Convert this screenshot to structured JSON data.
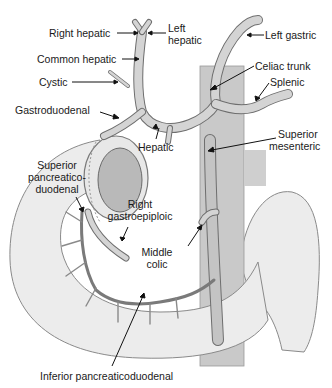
{
  "figure": {
    "colors": {
      "vessel_fill": "#d4d4d4",
      "vessel_stroke": "#6e6e6e",
      "organ_fill": "#ececec",
      "organ_stroke": "#8a8a8a",
      "aorta_fill": "#c9c9c9",
      "text": "#1a1a1a",
      "leader": "#111111"
    },
    "labels": {
      "right_hepatic": "Right hepatic",
      "left_hepatic_1": "Left",
      "left_hepatic_2": "hepatic",
      "left_gastric": "Left gastric",
      "common_hepatic": "Common hepatic",
      "celiac_trunk": "Celiac trunk",
      "cystic": "Cystic",
      "splenic": "Splenic",
      "gastroduodenal": "Gastroduodenal",
      "hepatic": "Hepatic",
      "superior_mesenteric_1": "Superior",
      "superior_mesenteric_2": "mesenteric",
      "sup_pd_1": "Superior",
      "sup_pd_2": "pancreatico-",
      "sup_pd_3": "duodenal",
      "right_gastroepiploic_1": "Right",
      "right_gastroepiploic_2": "gastroepiploic",
      "middle_colic_1": "Middle",
      "middle_colic_2": "colic",
      "inferior_pd": "Inferior pancreaticoduodenal"
    }
  }
}
